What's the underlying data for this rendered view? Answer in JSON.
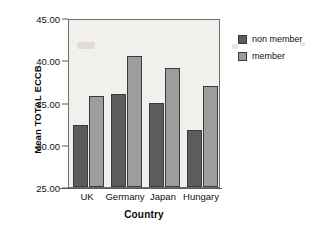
{
  "chart_data": {
    "type": "bar",
    "title": "",
    "subtitle": "",
    "xlabel": "Country",
    "ylabel": "Mean TOTAL ECCB",
    "categories": [
      "UK",
      "Germany",
      "Japan",
      "Hungary"
    ],
    "series": [
      {
        "name": "non member",
        "color": "#5c5c5c",
        "values": [
          32.3,
          36.0,
          35.0,
          31.8
        ]
      },
      {
        "name": "member",
        "color": "#9d9d9d",
        "values": [
          35.8,
          40.5,
          39.1,
          37.0
        ]
      }
    ],
    "ylim": [
      25.0,
      45.0
    ],
    "yticks": [
      25.0,
      30.0,
      35.0,
      40.0,
      45.0
    ],
    "ytick_labels": [
      "25.00",
      "30.00",
      "35.00",
      "40.00",
      "45.00"
    ],
    "grid": false,
    "legend_position": "right",
    "legend_entries": [
      "non member",
      "member"
    ],
    "plot_background": "#f1f0ec",
    "page_background": "#ffffff",
    "axis_color": "#6d6d6d"
  }
}
